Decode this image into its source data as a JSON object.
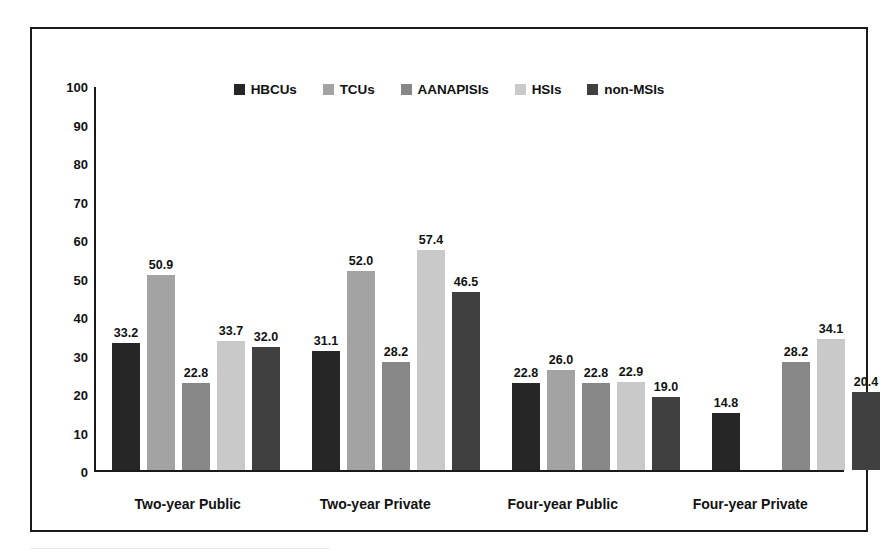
{
  "chart_data": {
    "type": "bar",
    "title": "",
    "subtitle": "",
    "xlabel": "",
    "ylabel": "",
    "ylim": [
      0,
      100
    ],
    "y_ticks": [
      0,
      10,
      20,
      30,
      40,
      50,
      60,
      70,
      80,
      90,
      100
    ],
    "grid": false,
    "legend_position": "top-center",
    "categories": [
      "Two-year Public",
      "Two-year Private",
      "Four-year Public",
      "Four-year Private"
    ],
    "series": [
      {
        "name": "HBCUs",
        "color": "#262626",
        "values": [
          33.2,
          31.1,
          22.8,
          14.8
        ],
        "labels": [
          "33.2",
          "31.1",
          "22.8",
          "14.8"
        ]
      },
      {
        "name": "TCUs",
        "color": "#a3a3a3",
        "values": [
          50.9,
          52.0,
          26.0,
          null
        ],
        "labels": [
          "50.9",
          "52.0",
          "26.0",
          ""
        ]
      },
      {
        "name": "AANAPISIs",
        "color": "#878787",
        "values": [
          22.8,
          28.2,
          22.8,
          28.2
        ],
        "labels": [
          "22.8",
          "28.2",
          "22.8",
          "28.2"
        ]
      },
      {
        "name": "HSIs",
        "color": "#c9c9c9",
        "values": [
          33.7,
          57.4,
          22.9,
          34.1
        ],
        "labels": [
          "33.7",
          "57.4",
          "22.9",
          "34.1"
        ]
      },
      {
        "name": "non-MSIs",
        "color": "#404040",
        "values": [
          32.0,
          46.5,
          19.0,
          20.4
        ],
        "labels": [
          "32.0",
          "46.5",
          "19.0",
          "20.4"
        ]
      }
    ]
  },
  "legend": {
    "items": [
      {
        "label": "HBCUs",
        "color": "#262626"
      },
      {
        "label": "TCUs",
        "color": "#a3a3a3"
      },
      {
        "label": "AANAPISIs",
        "color": "#878787"
      },
      {
        "label": "HSIs",
        "color": "#c9c9c9"
      },
      {
        "label": "non-MSIs",
        "color": "#404040"
      }
    ]
  },
  "axis": {
    "y_tick_labels": [
      "100",
      "90",
      "80",
      "70",
      "60",
      "50",
      "40",
      "30",
      "20",
      "10",
      "0"
    ],
    "x_category_labels": [
      "Two-year Public",
      "Two-year Private",
      "Four-year Public",
      "Four-year Private"
    ]
  }
}
